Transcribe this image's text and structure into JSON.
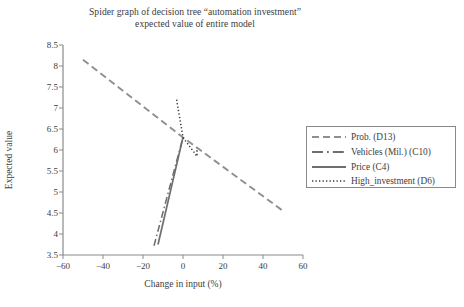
{
  "chart_data": {
    "type": "line",
    "title_line1": "Spider graph of decision tree “automation investment”",
    "title_line2": "expected value of entire model",
    "xlabel": "Change in input (%)",
    "ylabel": "Expected value",
    "xlim": [
      -60,
      60
    ],
    "ylim": [
      3.5,
      8.5
    ],
    "xticks": [
      -60,
      -40,
      -20,
      0,
      20,
      40,
      60
    ],
    "xtick_labels": [
      "−60",
      "−40",
      "−20",
      "0",
      "20",
      "40",
      "60"
    ],
    "yticks": [
      3.5,
      4,
      4.5,
      5,
      5.5,
      6,
      6.5,
      7,
      7.5,
      8,
      8.5
    ],
    "ytick_labels": [
      "3.5",
      "4",
      "4.5",
      "5",
      "5.5",
      "6",
      "6.5",
      "7",
      "7.5",
      "8",
      "8.5"
    ],
    "grid": false,
    "legend_position": "right",
    "line_color": "#808080",
    "axis_color": "#8a8a8a",
    "text_color": "#3d3d3d",
    "series": [
      {
        "name": "Prob. (D13)",
        "style": "dashed",
        "dasharray": "7,4",
        "width": 1.9,
        "color": "#8f8f8f",
        "x": [
          -50,
          0,
          50
        ],
        "y": [
          8.15,
          6.3,
          4.55
        ]
      },
      {
        "name": "Vehicles (Mil.) (C10)",
        "style": "dash-dot",
        "dasharray": "7,3,1.5,3",
        "width": 1.5,
        "color": "#6e6e6e",
        "x": [
          -14.5,
          0
        ],
        "y": [
          3.72,
          6.3
        ]
      },
      {
        "name": "Price (C4)",
        "style": "solid",
        "dasharray": "none",
        "width": 1.7,
        "color": "#6e6e6e",
        "x": [
          -12.5,
          0
        ],
        "y": [
          3.75,
          6.3
        ]
      },
      {
        "name": "High_investment (D6)",
        "style": "dotted",
        "dasharray": "1.3,2.2",
        "width": 1.5,
        "color": "#3a3a3a",
        "x": [
          -3.2,
          0,
          7,
          7
        ],
        "y": [
          7.2,
          6.3,
          5.85,
          6.05
        ]
      }
    ],
    "legend": [
      {
        "label": "Prob. (D13)",
        "style": "dashed"
      },
      {
        "label": "Vehicles (Mil.) (C10)",
        "style": "dash-dot"
      },
      {
        "label": "Price (C4)",
        "style": "solid"
      },
      {
        "label": "High_investment (D6)",
        "style": "dotted"
      }
    ]
  }
}
